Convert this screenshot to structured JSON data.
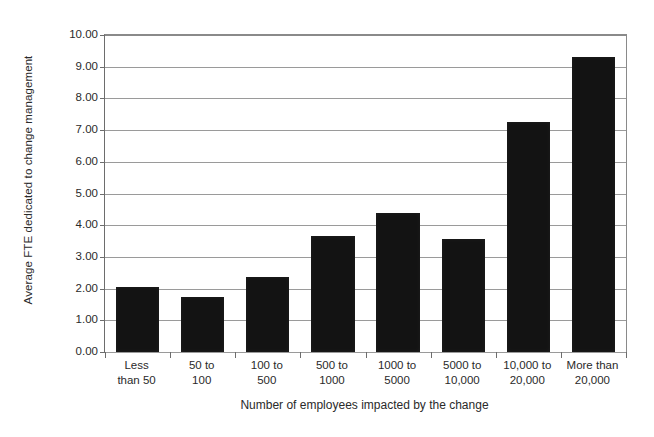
{
  "chart_data": {
    "type": "bar",
    "title": "",
    "xlabel": "Number of employees impacted by the change",
    "ylabel": "Average FTE dedicated to change management",
    "categories": [
      "Less\nthan 50",
      "50 to\n100",
      "100 to\n500",
      "500 to\n1000",
      "1000 to\n5000",
      "5000 to\n10,000",
      "10,000 to\n20,000",
      "More than\n20,000"
    ],
    "values": [
      2.05,
      1.72,
      2.38,
      3.65,
      4.4,
      3.58,
      7.25,
      9.3
    ],
    "ylim": [
      0,
      10
    ],
    "ytick_values": [
      0,
      1,
      2,
      3,
      4,
      5,
      6,
      7,
      8,
      9,
      10
    ],
    "ytick_labels": [
      "0.00",
      "1.00",
      "2.00",
      "3.00",
      "4.00",
      "5.00",
      "6.00",
      "7.00",
      "8.00",
      "9.00",
      "10.00"
    ],
    "grid": true,
    "legend": false,
    "bar_color": "#131313",
    "axis_color": "#6d6d6d",
    "gridline_color": "#9a9a9a",
    "background_color": "#ffffff"
  }
}
